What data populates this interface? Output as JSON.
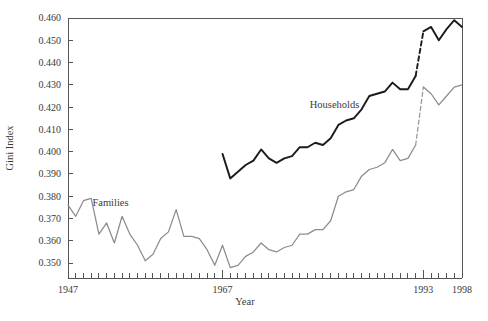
{
  "chart_data": {
    "type": "line",
    "title": "",
    "xlabel": "Year",
    "ylabel": "Gini Index",
    "xlim": [
      1947,
      1998
    ],
    "ylim": [
      0.3433,
      0.46
    ],
    "grid": false,
    "legend_position": "inline-annotation",
    "x_tick_labels": [
      "1947",
      "1967",
      "1993",
      "1998"
    ],
    "x_tick_label_years": [
      1947,
      1967,
      1993,
      1998
    ],
    "x_minor_tick_interval": 1,
    "y_tick_labels": [
      "0.460",
      "0.450",
      "0.440",
      "0.430",
      "0.420",
      "0.410",
      "0.400",
      "0.390",
      "0.380",
      "0.370",
      "0.360",
      "0.350"
    ],
    "y_tick_values": [
      0.46,
      0.45,
      0.44,
      0.43,
      0.42,
      0.41,
      0.4,
      0.39,
      0.38,
      0.37,
      0.36,
      0.35
    ],
    "annotations": [
      {
        "text": "Households",
        "year": 1981.5,
        "value": 0.4195
      },
      {
        "text": "Families",
        "year": 1952.5,
        "value": 0.3755
      }
    ],
    "series": [
      {
        "name": "Households",
        "color": "#1b1b1b",
        "style": "solid",
        "x": [
          1967,
          1968,
          1969,
          1970,
          1971,
          1972,
          1973,
          1974,
          1975,
          1976,
          1977,
          1978,
          1979,
          1980,
          1981,
          1982,
          1983,
          1984,
          1985,
          1986,
          1987,
          1988,
          1989,
          1990,
          1991,
          1992
        ],
        "values": [
          0.399,
          0.388,
          0.391,
          0.394,
          0.396,
          0.401,
          0.397,
          0.395,
          0.397,
          0.398,
          0.402,
          0.402,
          0.404,
          0.403,
          0.406,
          0.412,
          0.414,
          0.415,
          0.419,
          0.425,
          0.426,
          0.427,
          0.431,
          0.428,
          0.428,
          0.434
        ]
      },
      {
        "name": "Households (break bridge)",
        "color": "#1b1b1b",
        "style": "dashed",
        "x": [
          1992,
          1993
        ],
        "values": [
          0.434,
          0.454
        ]
      },
      {
        "name": "Households (post-1993 redesign)",
        "color": "#1b1b1b",
        "style": "solid",
        "x": [
          1993,
          1994,
          1995,
          1996,
          1997,
          1998
        ],
        "values": [
          0.454,
          0.456,
          0.45,
          0.455,
          0.459,
          0.456
        ]
      },
      {
        "name": "Families",
        "color": "#8c8c8c",
        "style": "solid",
        "x": [
          1947,
          1948,
          1949,
          1950,
          1951,
          1952,
          1953,
          1954,
          1955,
          1956,
          1957,
          1958,
          1959,
          1960,
          1961,
          1962,
          1963,
          1964,
          1965,
          1966,
          1967,
          1968,
          1969,
          1970,
          1971,
          1972,
          1973,
          1974,
          1975,
          1976,
          1977,
          1978,
          1979,
          1980,
          1981,
          1982,
          1983,
          1984,
          1985,
          1986,
          1987,
          1988,
          1989,
          1990,
          1991,
          1992
        ],
        "values": [
          0.376,
          0.371,
          0.378,
          0.379,
          0.363,
          0.368,
          0.359,
          0.371,
          0.363,
          0.358,
          0.351,
          0.354,
          0.361,
          0.364,
          0.374,
          0.362,
          0.362,
          0.361,
          0.356,
          0.349,
          0.358,
          0.348,
          0.349,
          0.353,
          0.355,
          0.359,
          0.356,
          0.355,
          0.357,
          0.358,
          0.363,
          0.363,
          0.365,
          0.365,
          0.369,
          0.38,
          0.382,
          0.383,
          0.389,
          0.392,
          0.393,
          0.395,
          0.401,
          0.396,
          0.397,
          0.403
        ]
      },
      {
        "name": "Families (break bridge)",
        "color": "#9a9a9a",
        "style": "dashed",
        "x": [
          1992,
          1993
        ],
        "values": [
          0.403,
          0.429
        ]
      },
      {
        "name": "Families (post-1993 redesign)",
        "color": "#8c8c8c",
        "style": "solid",
        "x": [
          1993,
          1994,
          1995,
          1996,
          1997,
          1998
        ],
        "values": [
          0.429,
          0.426,
          0.421,
          0.425,
          0.429,
          0.43
        ]
      }
    ]
  },
  "axes": {
    "ylabel": "Gini Index",
    "xlabel": "Year"
  }
}
